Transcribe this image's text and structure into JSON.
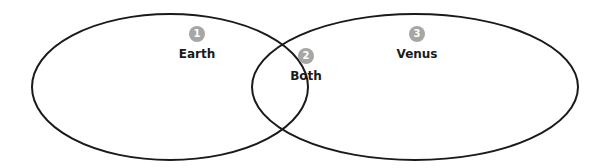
{
  "diagram": {
    "type": "venn",
    "stroke_color": "#1a1a1a",
    "badge_color": "#a6a6a6",
    "regions": [
      {
        "number": "1",
        "label": "Earth"
      },
      {
        "number": "2",
        "label": "Both"
      },
      {
        "number": "3",
        "label": "Venus"
      }
    ]
  }
}
